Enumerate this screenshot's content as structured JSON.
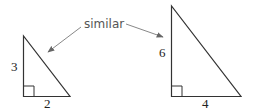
{
  "caption": {
    "text": "similar",
    "color": "#555555"
  },
  "triangles": [
    {
      "name": "small",
      "vertical_side_label": "3",
      "horizontal_side_label": "2",
      "right_angle_marker": true
    },
    {
      "name": "large",
      "vertical_side_label": "6",
      "horizontal_side_label": "4",
      "right_angle_marker": true
    }
  ],
  "arrows": [
    {
      "from": "caption",
      "to": "small-triangle"
    },
    {
      "from": "caption",
      "to": "large-triangle"
    }
  ],
  "colors": {
    "line": "#333333",
    "arrow": "#777777",
    "text": "#222222"
  }
}
